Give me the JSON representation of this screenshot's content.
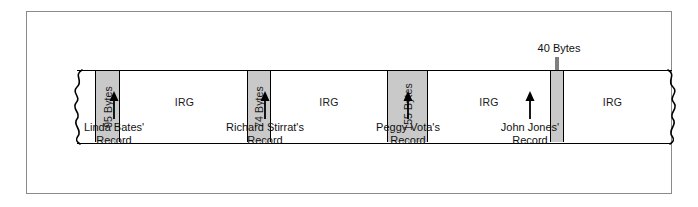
{
  "diagram": {
    "tape": {
      "left_break": "wavy-break-left",
      "right_break": "wavy-break-right"
    },
    "blocks": [
      {
        "id": "block-95",
        "label": "95 Bytes",
        "fill": "#c9c9c9"
      },
      {
        "id": "block-74",
        "label": "74 Bytes",
        "fill": "#c9c9c9"
      },
      {
        "id": "block-155",
        "label": "155 Bytes",
        "fill": "#c9c9c9"
      },
      {
        "id": "block-40",
        "label": "40 Bytes",
        "fill": "#c9c9c9"
      }
    ],
    "gaps": [
      {
        "id": "irg-1",
        "label": "IRG"
      },
      {
        "id": "irg-2",
        "label": "IRG"
      },
      {
        "id": "irg-3",
        "label": "IRG"
      },
      {
        "id": "irg-4",
        "label": "IRG"
      }
    ],
    "callouts": [
      {
        "id": "callout-linda",
        "line1": "Linda Bates'",
        "line2": "Record"
      },
      {
        "id": "callout-richard",
        "line1": "Richard Stirrat's",
        "line2": "Record"
      },
      {
        "id": "callout-peggy",
        "line1": "Peggy Vota's",
        "line2": "Record"
      },
      {
        "id": "callout-john",
        "line1": "John Jones'",
        "line2": "Record"
      }
    ],
    "top_callout": {
      "id": "callout-40-bytes",
      "label": "40 Bytes"
    },
    "colors": {
      "block_fill": "#c9c9c9",
      "stroke": "#000000",
      "frame": "#8a8a8a",
      "background": "#ffffff"
    }
  }
}
